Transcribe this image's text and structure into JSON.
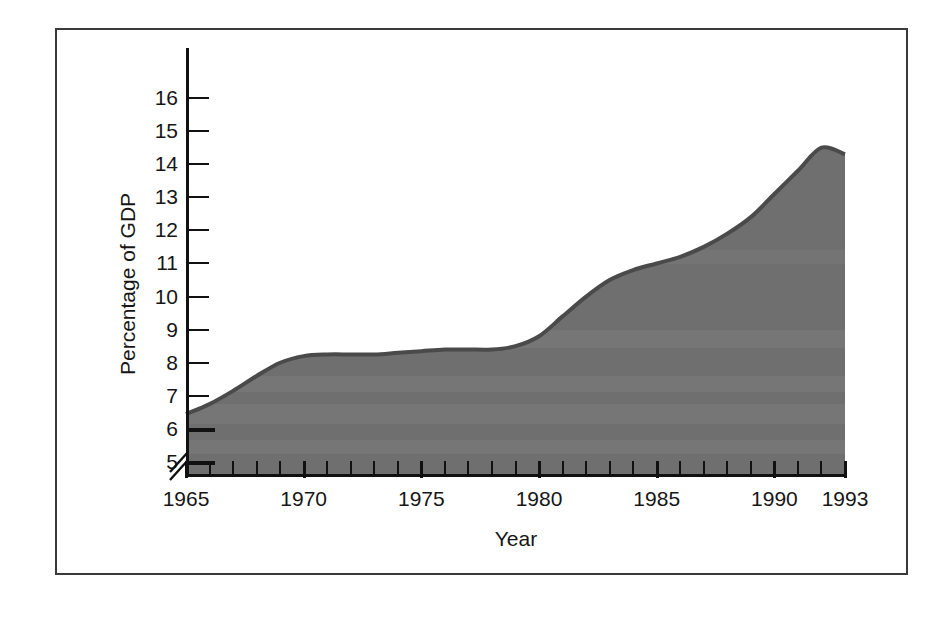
{
  "chart_data": {
    "type": "area",
    "title": "",
    "xlabel": "Year",
    "ylabel": "Percentage of GDP",
    "xlim": [
      1965,
      1993
    ],
    "ylim": [
      5,
      16.8
    ],
    "y_axis_break": true,
    "y_axis_break_note": "axis broken between 0 and 5",
    "grid": false,
    "legend": null,
    "x_tick_labels": [
      "1965",
      "1970",
      "1975",
      "1980",
      "1985",
      "1990",
      "1993"
    ],
    "x_tick_values": [
      1965,
      1970,
      1975,
      1980,
      1985,
      1990,
      1993
    ],
    "x_minor_tick_interval": 1,
    "y_tick_labels": [
      "5",
      "6",
      "7",
      "8",
      "9",
      "10",
      "11",
      "12",
      "13",
      "14",
      "15",
      "16"
    ],
    "y_tick_values": [
      5,
      6,
      7,
      8,
      9,
      10,
      11,
      12,
      13,
      14,
      15,
      16
    ],
    "series": [
      {
        "name": "Percentage of GDP",
        "fill_color": "#6f6f6f",
        "line_color": "#4a4a4a",
        "x": [
          1965,
          1966,
          1967,
          1968,
          1969,
          1970,
          1971,
          1972,
          1973,
          1974,
          1975,
          1976,
          1977,
          1978,
          1979,
          1980,
          1981,
          1982,
          1983,
          1984,
          1985,
          1986,
          1987,
          1988,
          1989,
          1990,
          1991,
          1992,
          1993
        ],
        "values": [
          6.45,
          6.75,
          7.15,
          7.6,
          8.0,
          8.2,
          8.25,
          8.25,
          8.25,
          8.3,
          8.35,
          8.4,
          8.4,
          8.4,
          8.5,
          8.8,
          9.4,
          10.0,
          10.5,
          10.8,
          11.0,
          11.2,
          11.5,
          11.9,
          12.4,
          13.1,
          13.8,
          14.5,
          14.3
        ]
      }
    ]
  },
  "figure": {
    "y_axis_title": "Percentage of GDP",
    "x_axis_title": "Year"
  }
}
